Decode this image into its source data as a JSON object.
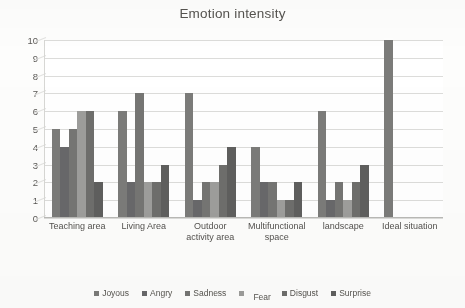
{
  "chart_data": {
    "type": "bar",
    "title": "Emotion intensity",
    "xlabel": "",
    "ylabel": "",
    "ylim": [
      0,
      10
    ],
    "ytick_step": 1,
    "yticks": [
      "10",
      "9",
      "8",
      "7",
      "6",
      "5",
      "4",
      "3",
      "2",
      "1",
      "0"
    ],
    "grid": true,
    "legend_position": "bottom",
    "categories": [
      "Teaching area",
      "Living Area",
      "Outdoor activity area",
      "Multifunctional space",
      "landscape",
      "Ideal situation"
    ],
    "series": [
      {
        "name": "Joyous",
        "color": "#7b7b79",
        "values": [
          5,
          6,
          7,
          4,
          6,
          10
        ]
      },
      {
        "name": "Angry",
        "color": "#68686a",
        "values": [
          4,
          2,
          1,
          2,
          1,
          0
        ]
      },
      {
        "name": "Sadness",
        "color": "#757573",
        "values": [
          5,
          7,
          2,
          2,
          2,
          0
        ]
      },
      {
        "name": "Fear",
        "color": "#9d9d9b",
        "values": [
          6,
          2,
          2,
          1,
          1,
          0
        ]
      },
      {
        "name": "Disgust",
        "color": "#6e6e6c",
        "values": [
          6,
          2,
          3,
          1,
          2,
          0
        ]
      },
      {
        "name": "Surprise",
        "color": "#5f5f5e",
        "values": [
          2,
          3,
          4,
          2,
          3,
          0
        ]
      }
    ]
  }
}
